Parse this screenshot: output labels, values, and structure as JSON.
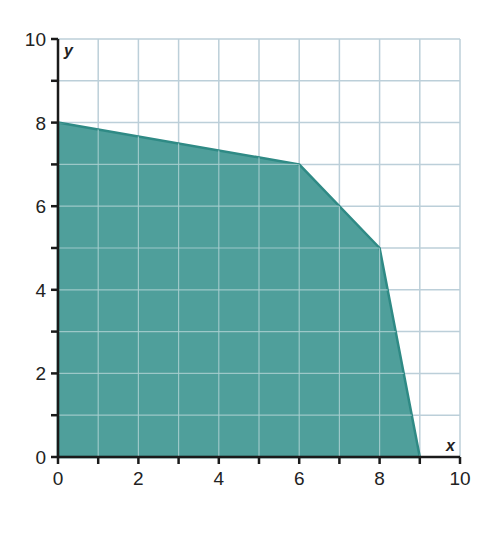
{
  "chart_data": {
    "type": "area",
    "title": "",
    "xlabel": "x",
    "ylabel": "y",
    "xlim": [
      0,
      10
    ],
    "ylim": [
      0,
      10
    ],
    "x_ticks_labeled": [
      0,
      2,
      4,
      6,
      8,
      10
    ],
    "y_ticks_labeled": [
      0,
      2,
      4,
      6,
      8,
      10
    ],
    "x_tick_labels": [
      "0",
      "2",
      "4",
      "6",
      "8",
      "10"
    ],
    "y_tick_labels": [
      "0",
      "2",
      "4",
      "6",
      "8",
      "10"
    ],
    "grid": true,
    "grid_step": 1,
    "legend": null,
    "series": [
      {
        "name": "feasible region",
        "kind": "shaded polygon",
        "points": [
          [
            0,
            0
          ],
          [
            0,
            8
          ],
          [
            6,
            7
          ],
          [
            8,
            5
          ],
          [
            9,
            0
          ]
        ]
      }
    ],
    "colors": {
      "fill": "#4f9f9b",
      "edge": "#2f8a85",
      "grid": "#bccfd9",
      "axis": "#1a1a1a"
    }
  }
}
